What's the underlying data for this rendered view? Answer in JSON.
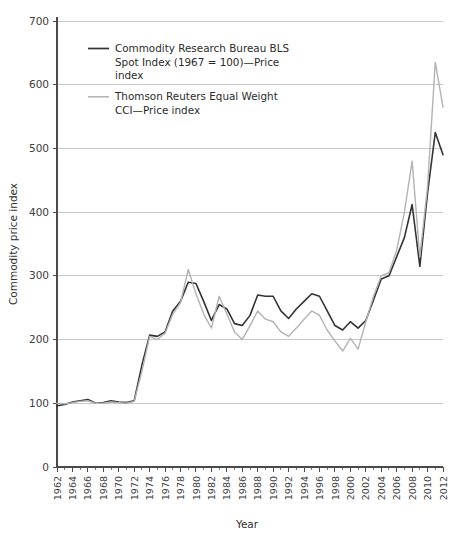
{
  "chart_data": {
    "type": "line",
    "title": "",
    "xlabel": "Year",
    "ylabel": "Commodity price index",
    "xlim": [
      1962,
      2012
    ],
    "ylim": [
      0,
      700
    ],
    "grid": true,
    "legend_position": "top-left-inside",
    "y_ticks": [
      "0",
      "100",
      "200",
      "300",
      "400",
      "500",
      "600",
      "700"
    ],
    "x_ticks": [
      "1962",
      "1964",
      "1966",
      "1968",
      "1970",
      "1972",
      "1974",
      "1976",
      "1978",
      "1980",
      "1982",
      "1984",
      "1986",
      "1988",
      "1990",
      "1992",
      "1994",
      "1996",
      "1998",
      "2000",
      "2002",
      "2004",
      "2006",
      "2008",
      "2010",
      "2012"
    ],
    "x": [
      1962,
      1963,
      1964,
      1965,
      1966,
      1967,
      1968,
      1969,
      1970,
      1971,
      1972,
      1973,
      1974,
      1975,
      1976,
      1977,
      1978,
      1979,
      1980,
      1981,
      1982,
      1983,
      1984,
      1985,
      1986,
      1987,
      1988,
      1989,
      1990,
      1991,
      1992,
      1993,
      1994,
      1995,
      1996,
      1997,
      1998,
      1999,
      2000,
      2001,
      2002,
      2003,
      2004,
      2005,
      2006,
      2007,
      2008,
      2009,
      2010,
      2011,
      2012
    ],
    "series": [
      {
        "name": "Commodity Research Bureau BLS Spot Index (1967 = 100)—Price index",
        "color": "#333333",
        "width": 1.6,
        "values": [
          96,
          98,
          102,
          104,
          106,
          100,
          101,
          104,
          102,
          101,
          104,
          160,
          207,
          205,
          212,
          245,
          260,
          290,
          288,
          260,
          230,
          255,
          248,
          225,
          222,
          238,
          270,
          268,
          268,
          245,
          233,
          248,
          260,
          272,
          268,
          245,
          222,
          215,
          228,
          218,
          230,
          262,
          295,
          300,
          330,
          360,
          412,
          315,
          430,
          525,
          490
        ]
      },
      {
        "name": "Thomson Reuters Equal Weight CCI—Price index",
        "color": "#b3b3b3",
        "width": 1.4,
        "values": [
          100,
          99,
          101,
          103,
          104,
          100,
          100,
          102,
          101,
          100,
          103,
          150,
          205,
          200,
          210,
          240,
          258,
          310,
          272,
          240,
          218,
          268,
          240,
          212,
          200,
          222,
          245,
          232,
          228,
          212,
          205,
          218,
          232,
          245,
          238,
          215,
          198,
          182,
          202,
          185,
          228,
          268,
          300,
          305,
          340,
          400,
          480,
          330,
          440,
          635,
          565
        ]
      }
    ],
    "legend": [
      {
        "label_lines": [
          "Commodity Research Bureau BLS",
          "Spot Index (1967 = 100)—Price",
          "index"
        ],
        "color": "#333333"
      },
      {
        "label_lines": [
          "Thomson Reuters Equal Weight",
          "CCI—Price index"
        ],
        "color": "#b3b3b3"
      }
    ]
  }
}
